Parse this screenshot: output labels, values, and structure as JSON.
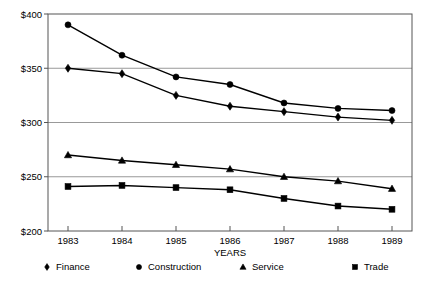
{
  "chart_data": {
    "type": "line",
    "title": "",
    "xlabel": "YEARS",
    "ylabel": "",
    "categories": [
      "1983",
      "1984",
      "1985",
      "1986",
      "1987",
      "1988",
      "1989"
    ],
    "x_tick_labels": [
      "1983",
      "1984",
      "1985",
      "1986",
      "1987",
      "1988",
      "1989"
    ],
    "y_tick_labels": [
      "$200",
      "$250",
      "$300",
      "$350",
      "$400"
    ],
    "y_tick_values": [
      200,
      250,
      300,
      350,
      400
    ],
    "ylim": [
      200,
      400
    ],
    "grid": "horizontal",
    "legend_position": "bottom",
    "series": [
      {
        "name": "Finance",
        "marker": "diamond",
        "values": [
          350,
          345,
          325,
          315,
          310,
          305,
          302
        ]
      },
      {
        "name": "Construction",
        "marker": "circle",
        "values": [
          390,
          362,
          342,
          335,
          318,
          313,
          311
        ]
      },
      {
        "name": "Service",
        "marker": "triangle",
        "values": [
          270,
          265,
          261,
          257,
          250,
          246,
          239
        ]
      },
      {
        "name": "Trade",
        "marker": "square",
        "values": [
          241,
          242,
          240,
          238,
          230,
          223,
          220
        ]
      }
    ]
  },
  "legend": {
    "items": [
      {
        "label": "Finance",
        "marker": "diamond-marker-icon"
      },
      {
        "label": "Construction",
        "marker": "circle-marker-icon"
      },
      {
        "label": "Service",
        "marker": "triangle-marker-icon"
      },
      {
        "label": "Trade",
        "marker": "square-marker-icon"
      }
    ]
  },
  "colors": {
    "ink": "#000000",
    "grid": "#999999",
    "frame": "#555555",
    "background": "#ffffff"
  }
}
